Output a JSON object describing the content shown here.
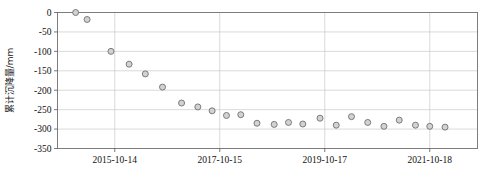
{
  "chart_data": {
    "type": "scatter",
    "title": "",
    "xlabel": "",
    "ylabel": "累计沉降量/mm",
    "ylim": [
      -350,
      0
    ],
    "yticks": [
      0,
      -50,
      -100,
      -150,
      -200,
      -250,
      -300,
      -350
    ],
    "ytick_labels": [
      "0",
      "-50",
      "-100",
      "-150",
      "-200",
      "-250",
      "-300",
      "-350"
    ],
    "xtick_labels": [
      "2015-10-14",
      "2017-10-15",
      "2019-10-17",
      "2021-10-18"
    ],
    "xtick_index": [
      6,
      17,
      28,
      39
    ],
    "xlim_index": [
      0,
      44
    ],
    "grid": true,
    "legend": null,
    "marker": {
      "shape": "circle",
      "fill_color": "#d2d2d2",
      "edge_color": "#6f6f6f"
    },
    "series": [
      {
        "name": "累计沉降量",
        "x_index": [
          1.9,
          3.1,
          5.6,
          7.5,
          9.2,
          11.0,
          13.0,
          14.7,
          16.2,
          17.7,
          19.2,
          20.9,
          22.7,
          24.2,
          25.7,
          27.5,
          29.2,
          30.8,
          32.5,
          34.2,
          35.8,
          37.5,
          39.0,
          40.6
        ],
        "values": [
          0,
          -18,
          -100,
          -133,
          -158,
          -192,
          -233,
          -243,
          -253,
          -265,
          -263,
          -285,
          -288,
          -283,
          -287,
          -272,
          -290,
          -268,
          -283,
          -293,
          -277,
          -290,
          -293,
          -295
        ]
      }
    ]
  },
  "axis": {
    "ylabel_text": "累计沉降量/mm"
  }
}
